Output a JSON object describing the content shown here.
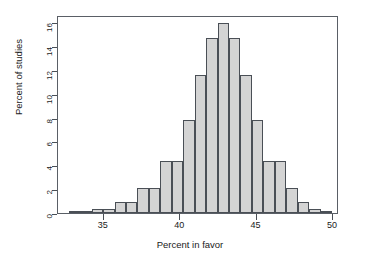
{
  "chart_data": {
    "type": "bar",
    "title": "",
    "subtitle": "",
    "xlabel": "Percent in favor",
    "ylabel": "Percent of studies",
    "xlim": [
      32.0,
      50.4
    ],
    "ylim": [
      0,
      16.6
    ],
    "xticks": [
      35,
      40,
      45,
      50
    ],
    "yticks": [
      0,
      2,
      4,
      6,
      8,
      10,
      12,
      14,
      16
    ],
    "xtick_labels": [
      "35",
      "40",
      "45",
      "50"
    ],
    "ytick_labels": [
      "0",
      "2",
      "4",
      "6",
      "8",
      "10",
      "12",
      "14",
      "16"
    ],
    "grid": false,
    "legend": null,
    "bin_width": 0.75,
    "bin_edges": [
      32.7,
      33.45,
      34.2,
      34.95,
      35.7,
      36.45,
      37.2,
      37.95,
      38.7,
      39.45,
      40.2,
      40.95,
      41.7,
      42.45,
      43.2,
      43.95,
      44.7,
      45.45,
      46.2,
      46.95,
      47.7,
      48.45,
      49.2,
      49.95
    ],
    "bin_centers": [
      33.08,
      33.83,
      34.58,
      35.33,
      36.08,
      36.83,
      37.58,
      38.33,
      39.08,
      39.83,
      40.58,
      41.33,
      42.08,
      42.83,
      43.58,
      44.33,
      45.08,
      45.83,
      46.58,
      47.33,
      48.08,
      48.83,
      49.58
    ],
    "values": [
      0.05,
      0.1,
      0.3,
      0.3,
      0.9,
      0.9,
      2.1,
      2.1,
      4.4,
      4.4,
      7.8,
      11.6,
      14.7,
      15.9,
      14.7,
      11.6,
      7.8,
      4.4,
      4.4,
      2.1,
      0.9,
      0.3,
      0.1
    ],
    "bar_fill": "#d4d4d4",
    "bar_edge": "#4a4f56",
    "frame_color": "#5a5f66",
    "background": "#ffffff"
  },
  "axes": {
    "x_title": "Percent in favor",
    "y_title": "Percent of studies"
  }
}
